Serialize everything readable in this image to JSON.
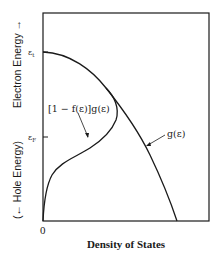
{
  "diagram": {
    "y_axis_label_upper": "Electron Energy →",
    "y_axis_label_lower": "(← Hole Energy)",
    "x_axis_label": "Density of States",
    "x_origin_label": "0",
    "y_ticks": [
      {
        "label": "ε",
        "subscript": "t",
        "name": "top-of-band"
      },
      {
        "label": "ε",
        "subscript": "F",
        "name": "fermi-level"
      }
    ],
    "curves": [
      {
        "name": "density-of-states",
        "label": "g(ε)"
      },
      {
        "name": "unoccupied-states",
        "label": "[1 − f(ε)]g(ε)"
      }
    ],
    "colors": {
      "line": "#1a1a1a",
      "background": "#ffffff"
    }
  }
}
